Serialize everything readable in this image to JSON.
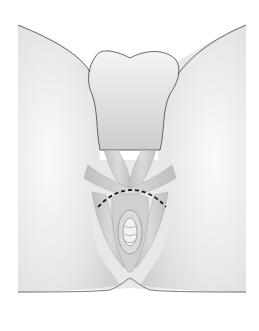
{
  "figure": {
    "kind": "anatomical-illustration",
    "style": "grayscale line drawing with shading",
    "annotations": {
      "dashed_line": {
        "color": "#1a1a1a",
        "description": "curved dashed incision line"
      }
    },
    "colors": {
      "background": "#ffffff",
      "outline": "#555555",
      "skin_light": "#efefef",
      "skin_mid": "#d6d6d6",
      "muscle": "#c4c4c4",
      "muscle_dark": "#a9a9a9"
    }
  }
}
